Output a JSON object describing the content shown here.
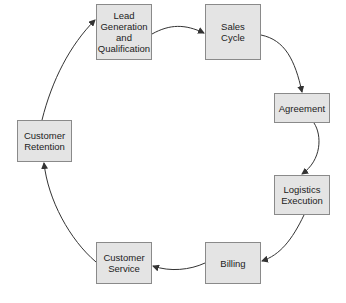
{
  "diagram": {
    "type": "cycle",
    "nodes": [
      {
        "id": "lead",
        "label": "Lead\nGeneration\nand\nQualification"
      },
      {
        "id": "sales",
        "label": "Sales\nCycle"
      },
      {
        "id": "agreement",
        "label": "Agreement"
      },
      {
        "id": "logistics",
        "label": "Logistics\nExecution"
      },
      {
        "id": "billing",
        "label": "Billing"
      },
      {
        "id": "service",
        "label": "Customer\nService"
      },
      {
        "id": "retention",
        "label": "Customer\nRetention"
      }
    ],
    "edges": [
      {
        "from": "lead",
        "to": "sales"
      },
      {
        "from": "sales",
        "to": "agreement"
      },
      {
        "from": "agreement",
        "to": "logistics"
      },
      {
        "from": "logistics",
        "to": "billing"
      },
      {
        "from": "billing",
        "to": "service"
      },
      {
        "from": "service",
        "to": "retention"
      },
      {
        "from": "retention",
        "to": "lead"
      }
    ],
    "colors": {
      "node_fill": "#e4e4e4",
      "node_border": "#8a8a8a",
      "edge": "#333333"
    }
  }
}
